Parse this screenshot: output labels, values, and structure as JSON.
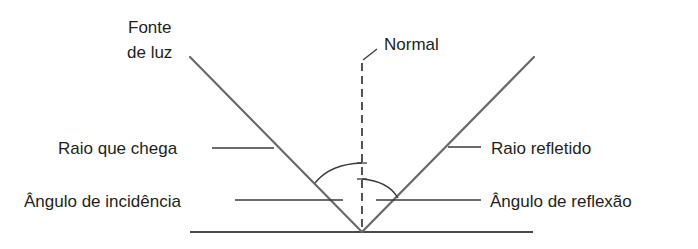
{
  "diagram": {
    "labels": {
      "light_source_line1": "Fonte",
      "light_source_line2": "de luz",
      "normal": "Normal",
      "incident_ray": "Raio que chega",
      "reflected_ray": "Raio refletido",
      "angle_incidence": "Ângulo de incidência",
      "angle_reflection": "Ângulo de reflexão"
    },
    "colors": {
      "text": "#231f20",
      "ray": "#6a6a6a",
      "leader": "#3a3a3a",
      "normal": "#2a2a2a",
      "surface": "#4a4a4a",
      "background": "#ffffff"
    }
  }
}
